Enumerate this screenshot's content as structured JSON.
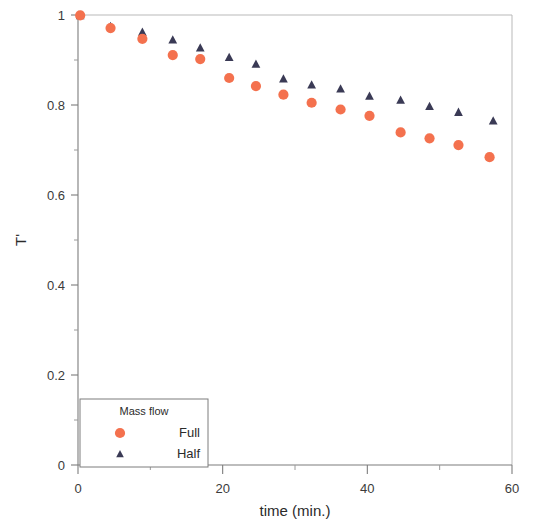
{
  "chart_data": {
    "type": "scatter",
    "title": "",
    "xlabel": "time (min.)",
    "ylabel": "T'",
    "xlim": [
      0,
      60
    ],
    "ylim": [
      0,
      1
    ],
    "xticks": [
      0,
      20,
      40,
      60
    ],
    "xtick_labels": [
      "0",
      "20",
      "40",
      "60"
    ],
    "xminor_ticks": [
      10,
      30,
      50
    ],
    "yticks": [
      0,
      0.2,
      0.4,
      0.6,
      0.8,
      1
    ],
    "ytick_labels": [
      "0",
      "0.2",
      "0.4",
      "0.6",
      "0.8",
      "1"
    ],
    "yminor_ticks": [
      0.1,
      0.3,
      0.5,
      0.7,
      0.9
    ],
    "grid": false,
    "legend": {
      "title": "Mass flow",
      "position": "bottom-left",
      "entries": [
        {
          "name": "Full",
          "marker": "circle",
          "color": "#F4714E"
        },
        {
          "name": "Half",
          "marker": "triangle",
          "color": "#3A3A55"
        }
      ]
    },
    "series": [
      {
        "name": "Full",
        "marker": "circle",
        "color": "#F4714E",
        "x": [
          0.3,
          4.5,
          8.9,
          13.1,
          16.9,
          20.9,
          24.6,
          28.4,
          32.3,
          36.3,
          40.3,
          44.6,
          48.6,
          52.6,
          56.9
        ],
        "y": [
          0.999,
          0.971,
          0.947,
          0.911,
          0.902,
          0.86,
          0.842,
          0.823,
          0.805,
          0.79,
          0.776,
          0.739,
          0.726,
          0.711,
          0.684
        ]
      },
      {
        "name": "Half",
        "marker": "triangle",
        "color": "#3A3A55",
        "x": [
          0.3,
          4.5,
          8.9,
          13.1,
          16.9,
          20.9,
          24.6,
          28.4,
          32.3,
          36.3,
          40.3,
          44.6,
          48.6,
          52.6,
          57.4
        ],
        "y": [
          0.999,
          0.975,
          0.962,
          0.945,
          0.927,
          0.906,
          0.891,
          0.858,
          0.845,
          0.836,
          0.82,
          0.811,
          0.797,
          0.784,
          0.765
        ]
      }
    ]
  }
}
